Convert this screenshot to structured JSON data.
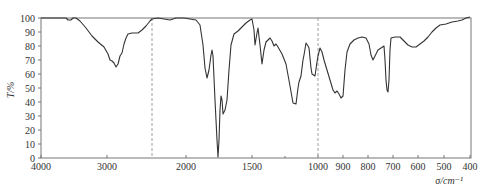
{
  "chart_data": {
    "type": "line",
    "title": "",
    "xlabel": "σ/cm⁻¹",
    "ylabel": "T/%",
    "xlim": [
      4000,
      400
    ],
    "ylim": [
      0,
      100
    ],
    "grid": false,
    "legend": null,
    "x_ticks": [
      4000,
      3000,
      2000,
      1500,
      1000,
      900,
      800,
      700,
      600,
      500,
      400
    ],
    "y_ticks": [
      0,
      10,
      20,
      30,
      40,
      50,
      60,
      70,
      80,
      90,
      100
    ],
    "scale_breaks": [
      2200,
      1000
    ],
    "annotations": [
      "dashed vertical line near 2200 cm⁻¹",
      "dashed vertical line at 1000 cm⁻¹ (scale change)"
    ],
    "series": [
      {
        "name": "IR spectrum",
        "color": "#333333",
        "points_px": [
          [
            41,
            18
          ],
          [
            66,
            18
          ],
          [
            68,
            20
          ],
          [
            71,
            20
          ],
          [
            73,
            18
          ],
          [
            76,
            18
          ],
          [
            80,
            21
          ],
          [
            86,
            28
          ],
          [
            92,
            36
          ],
          [
            98,
            42
          ],
          [
            104,
            47
          ],
          [
            108,
            54
          ],
          [
            110,
            60
          ],
          [
            112,
            61
          ],
          [
            114,
            63
          ],
          [
            116,
            67
          ],
          [
            118,
            64
          ],
          [
            120,
            56
          ],
          [
            122,
            53
          ],
          [
            124,
            44
          ],
          [
            126,
            38
          ],
          [
            128,
            34
          ],
          [
            132,
            33
          ],
          [
            138,
            33
          ],
          [
            142,
            30
          ],
          [
            146,
            26
          ],
          [
            150,
            21
          ],
          [
            152,
            19
          ],
          [
            158,
            18
          ],
          [
            164,
            19
          ],
          [
            170,
            20
          ],
          [
            176,
            18
          ],
          [
            184,
            18
          ],
          [
            190,
            19
          ],
          [
            196,
            20
          ],
          [
            200,
            25
          ],
          [
            203,
            45
          ],
          [
            205,
            68
          ],
          [
            207,
            78
          ],
          [
            209,
            70
          ],
          [
            211,
            55
          ],
          [
            212,
            50
          ],
          [
            213,
            56
          ],
          [
            215,
            100
          ],
          [
            217,
            140
          ],
          [
            218,
            157
          ],
          [
            219,
            140
          ],
          [
            220,
            110
          ],
          [
            221,
            96
          ],
          [
            222,
            100
          ],
          [
            223,
            114
          ],
          [
            225,
            110
          ],
          [
            227,
            100
          ],
          [
            229,
            70
          ],
          [
            231,
            45
          ],
          [
            234,
            34
          ],
          [
            238,
            31
          ],
          [
            242,
            27
          ],
          [
            246,
            23
          ],
          [
            250,
            20
          ],
          [
            252,
            19
          ],
          [
            254,
            30
          ],
          [
            255,
            45
          ],
          [
            257,
            33
          ],
          [
            258,
            28
          ],
          [
            260,
            45
          ],
          [
            262,
            64
          ],
          [
            264,
            50
          ],
          [
            266,
            42
          ],
          [
            270,
            38
          ],
          [
            272,
            41
          ],
          [
            274,
            46
          ],
          [
            276,
            44
          ],
          [
            278,
            47
          ],
          [
            282,
            54
          ],
          [
            286,
            64
          ],
          [
            290,
            86
          ],
          [
            293,
            103
          ],
          [
            296,
            104
          ],
          [
            298,
            88
          ],
          [
            299,
            82
          ],
          [
            301,
            76
          ],
          [
            303,
            60
          ],
          [
            304,
            55
          ],
          [
            306,
            43
          ],
          [
            308,
            46
          ],
          [
            309,
            48
          ],
          [
            311,
            68
          ],
          [
            312,
            74
          ],
          [
            315,
            76
          ],
          [
            317,
            62
          ],
          [
            318,
            56
          ],
          [
            320,
            48
          ],
          [
            322,
            52
          ],
          [
            324,
            60
          ],
          [
            327,
            70
          ],
          [
            330,
            80
          ],
          [
            333,
            90
          ],
          [
            335,
            93
          ],
          [
            337,
            91
          ],
          [
            339,
            94
          ],
          [
            341,
            98
          ],
          [
            343,
            96
          ],
          [
            345,
            70
          ],
          [
            347,
            52
          ],
          [
            350,
            44
          ],
          [
            354,
            40
          ],
          [
            358,
            38
          ],
          [
            362,
            37
          ],
          [
            366,
            38
          ],
          [
            369,
            44
          ],
          [
            371,
            55
          ],
          [
            373,
            60
          ],
          [
            375,
            56
          ],
          [
            378,
            50
          ],
          [
            381,
            48
          ],
          [
            384,
            46
          ],
          [
            385,
            60
          ],
          [
            386,
            80
          ],
          [
            387,
            90
          ],
          [
            388,
            92
          ],
          [
            389,
            80
          ],
          [
            390,
            50
          ],
          [
            391,
            38
          ],
          [
            395,
            37
          ],
          [
            400,
            37
          ],
          [
            404,
            41
          ],
          [
            408,
            45
          ],
          [
            412,
            47
          ],
          [
            416,
            47
          ],
          [
            420,
            44
          ],
          [
            424,
            41
          ],
          [
            428,
            37
          ],
          [
            432,
            32
          ],
          [
            436,
            28
          ],
          [
            440,
            25
          ],
          [
            446,
            24
          ],
          [
            452,
            22
          ],
          [
            458,
            21
          ],
          [
            462,
            20
          ],
          [
            466,
            18
          ],
          [
            470,
            17
          ]
        ]
      }
    ]
  },
  "axes": {
    "ylabel": "T/%",
    "xlabel": "σ/cm⁻¹",
    "x_tick_labels": [
      "4000",
      "3000",
      "2000",
      "1500",
      "1000",
      "900",
      "800",
      "700",
      "600",
      "500",
      "400"
    ],
    "y_tick_labels": [
      "0",
      "10",
      "20",
      "30",
      "40",
      "50",
      "60",
      "70",
      "80",
      "90",
      "100"
    ]
  }
}
